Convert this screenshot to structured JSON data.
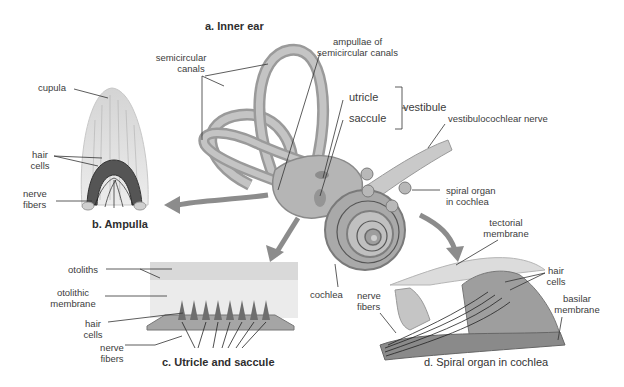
{
  "diagram": {
    "palette": {
      "background": "#ffffff",
      "tissue_light": "#d9d9d9",
      "tissue_mid": "#a8a8a8",
      "tissue_dark": "#6e6e6e",
      "line": "#2a2a2a",
      "arrow": "#8c8c8c"
    },
    "panels": {
      "a": {
        "title": "a. Inner ear",
        "labels": {
          "semicircular_canals": [
            "semicircular",
            "canals"
          ],
          "ampullae": [
            "ampullae of",
            "semicircular canals"
          ],
          "utricle": "utricle",
          "saccule": "saccule",
          "vestibule": "vestibule",
          "vestibulocochlear_nerve": "vestibulocochlear nerve",
          "spiral_organ": [
            "spiral organ",
            "in cochlea"
          ],
          "cochlea": "cochlea"
        }
      },
      "b": {
        "title": "b. Ampulla",
        "labels": {
          "cupula": "cupula",
          "hair_cells": [
            "hair",
            "cells"
          ],
          "nerve_fibers": [
            "nerve",
            "fibers"
          ]
        }
      },
      "c": {
        "title": "c. Utricle and saccule",
        "labels": {
          "otoliths": "otoliths",
          "otolithic_membrane": [
            "otolithic",
            "membrane"
          ],
          "hair_cells": [
            "hair",
            "cells"
          ],
          "nerve_fibers": [
            "nerve",
            "fibers"
          ]
        }
      },
      "d": {
        "title": "d. Spiral organ in cochlea",
        "labels": {
          "tectorial_membrane": [
            "tectorial",
            "membrane"
          ],
          "hair_cells": [
            "hair",
            "cells"
          ],
          "basilar_membrane": [
            "basilar",
            "membrane"
          ],
          "nerve_fibers": [
            "nerve",
            "fibers"
          ]
        }
      }
    }
  }
}
